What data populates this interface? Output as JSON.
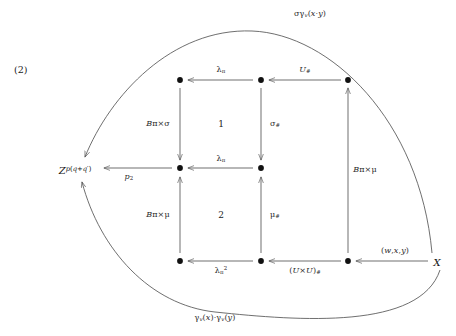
{
  "figure": {
    "equation_number": "(2)",
    "caption": "",
    "background_color": "#ffffff",
    "stroke_color": "#555555",
    "text_color": "#1a1a1a"
  },
  "objects": [
    {
      "id": "Z",
      "label": "Z^{p(q+q')}",
      "label_html": "<i>Z</i><sup><i>p</i>(<i>q</i>+<i>q</i>&prime;)</sup>",
      "x": 75,
      "y": 170
    },
    {
      "id": "X",
      "label": "X",
      "label_html": "<i>X</i>",
      "x": 437,
      "y": 262
    }
  ],
  "nodes": [
    {
      "id": "n_tl",
      "x": 180,
      "y": 80
    },
    {
      "id": "n_tm",
      "x": 261,
      "y": 80
    },
    {
      "id": "n_tr",
      "x": 348,
      "y": 80
    },
    {
      "id": "n_ml",
      "x": 180,
      "y": 168
    },
    {
      "id": "n_mm",
      "x": 261,
      "y": 168
    },
    {
      "id": "n_bl",
      "x": 180,
      "y": 261
    },
    {
      "id": "n_bm",
      "x": 261,
      "y": 261
    },
    {
      "id": "n_br",
      "x": 348,
      "y": 261
    }
  ],
  "arrow_labels": {
    "top_curve": {
      "text": "σγ_v(x·y)",
      "html": "&sigma;&gamma;<sub><i>v</i></sub>(<i>x</i>&middot;<i>y</i>)",
      "x": 310,
      "y": 14
    },
    "bottom_curve": {
      "text": "γ_v(x)·γ_v(y)",
      "html": "&gamma;<sub><i>v</i></sub>(<i>x</i>)&middot;&gamma;<sub><i>v</i></sub>(<i>y</i>)",
      "x": 215,
      "y": 318
    },
    "top_left": {
      "text": "λ_π",
      "html": "&lambda;<sub>&pi;</sub>",
      "x": 221,
      "y": 70
    },
    "top_right": {
      "text": "U_#",
      "html": "<i>U</i><sub>#</sub>",
      "x": 305,
      "y": 70
    },
    "mid_left": {
      "text": "p_2",
      "html": "<i>p</i><sub>2</sub>",
      "x": 129,
      "y": 177
    },
    "mid_right": {
      "text": "λ_π",
      "html": "&lambda;<sub>&pi;</sub>",
      "x": 221,
      "y": 159
    },
    "bottom_left": {
      "text": "λ_π^2",
      "html": "&lambda;<sub>&pi;</sub><sup>2</sup>",
      "x": 221,
      "y": 271
    },
    "bottom_right": {
      "text": "(U×U)_#",
      "html": "(<i>U</i>&times;<i>U</i>)<sub>#</sub>",
      "x": 305,
      "y": 271
    },
    "far_bottom_right": {
      "text": "(w,x,y)",
      "html": "(<i>w</i>,<i>x</i>,<i>y</i>)",
      "x": 395,
      "y": 251
    },
    "vert_left_upper": {
      "text": "Bπ×σ",
      "html": "<i>B</i>&pi;&times;&sigma;",
      "x": 158,
      "y": 124
    },
    "vert_mid_upper": {
      "text": "σ_#",
      "html": "&sigma;<sub>#</sub>",
      "x": 275,
      "y": 124
    },
    "vert_left_lower": {
      "text": "Bπ×μ",
      "html": "<i>B</i>&pi;&times;&mu;",
      "x": 158,
      "y": 215
    },
    "vert_mid_lower": {
      "text": "μ_#",
      "html": "&mu;<sub>#</sub>",
      "x": 275,
      "y": 215
    },
    "vert_right": {
      "text": "Bπ×μ",
      "html": "<i>B</i>&pi;&times;&mu;",
      "x": 365,
      "y": 170
    }
  },
  "cells": [
    {
      "label": "1",
      "x": 221,
      "y": 124
    },
    {
      "label": "2",
      "x": 221,
      "y": 215
    }
  ]
}
